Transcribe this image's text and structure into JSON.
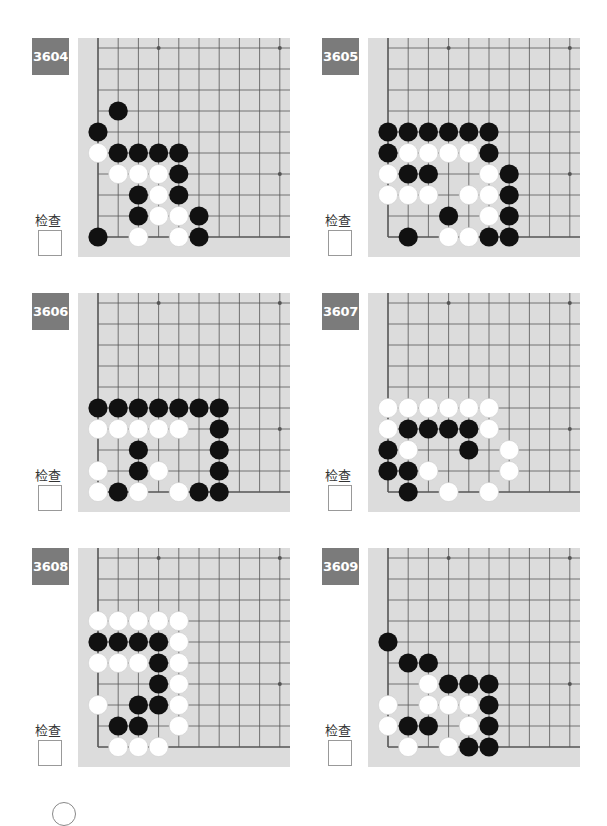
{
  "colors": {
    "badge_bg": "#7b7b7b",
    "board_bg": "#dcdcdc",
    "grid_line": "#555555",
    "black_stone": "#111111",
    "white_stone": "#ffffff"
  },
  "check_label": "检查",
  "problems": [
    {
      "number": "3604",
      "black": [
        [
          1,
          3
        ],
        [
          0,
          4
        ],
        [
          1,
          5
        ],
        [
          2,
          5
        ],
        [
          3,
          5
        ],
        [
          4,
          5
        ],
        [
          4,
          6
        ],
        [
          2,
          7
        ],
        [
          4,
          7
        ],
        [
          2,
          8
        ],
        [
          5,
          8
        ],
        [
          0,
          9
        ],
        [
          5,
          9
        ]
      ],
      "white": [
        [
          0,
          5
        ],
        [
          1,
          6
        ],
        [
          2,
          6
        ],
        [
          3,
          6
        ],
        [
          3,
          7
        ],
        [
          3,
          8
        ],
        [
          4,
          8
        ],
        [
          2,
          9
        ],
        [
          4,
          9
        ]
      ]
    },
    {
      "number": "3605",
      "black": [
        [
          0,
          4
        ],
        [
          1,
          4
        ],
        [
          2,
          4
        ],
        [
          3,
          4
        ],
        [
          4,
          4
        ],
        [
          5,
          4
        ],
        [
          0,
          5
        ],
        [
          5,
          5
        ],
        [
          1,
          6
        ],
        [
          2,
          6
        ],
        [
          6,
          6
        ],
        [
          6,
          7
        ],
        [
          3,
          8
        ],
        [
          6,
          8
        ],
        [
          1,
          9
        ],
        [
          5,
          9
        ],
        [
          6,
          9
        ]
      ],
      "white": [
        [
          1,
          5
        ],
        [
          2,
          5
        ],
        [
          3,
          5
        ],
        [
          4,
          5
        ],
        [
          0,
          6
        ],
        [
          5,
          6
        ],
        [
          0,
          7
        ],
        [
          1,
          7
        ],
        [
          2,
          7
        ],
        [
          4,
          7
        ],
        [
          5,
          7
        ],
        [
          5,
          8
        ],
        [
          3,
          9
        ],
        [
          4,
          9
        ]
      ]
    },
    {
      "number": "3606",
      "black": [
        [
          0,
          5
        ],
        [
          1,
          5
        ],
        [
          2,
          5
        ],
        [
          3,
          5
        ],
        [
          4,
          5
        ],
        [
          5,
          5
        ],
        [
          6,
          5
        ],
        [
          6,
          6
        ],
        [
          2,
          7
        ],
        [
          6,
          7
        ],
        [
          2,
          8
        ],
        [
          6,
          8
        ],
        [
          1,
          9
        ],
        [
          5,
          9
        ],
        [
          6,
          9
        ]
      ],
      "white": [
        [
          0,
          6
        ],
        [
          1,
          6
        ],
        [
          2,
          6
        ],
        [
          3,
          6
        ],
        [
          4,
          6
        ],
        [
          0,
          8
        ],
        [
          3,
          8
        ],
        [
          0,
          9
        ],
        [
          2,
          9
        ],
        [
          4,
          9
        ]
      ]
    },
    {
      "number": "3607",
      "black": [
        [
          1,
          6
        ],
        [
          2,
          6
        ],
        [
          3,
          6
        ],
        [
          4,
          6
        ],
        [
          0,
          7
        ],
        [
          4,
          7
        ],
        [
          0,
          8
        ],
        [
          1,
          8
        ],
        [
          1,
          9
        ]
      ],
      "white": [
        [
          0,
          5
        ],
        [
          1,
          5
        ],
        [
          2,
          5
        ],
        [
          3,
          5
        ],
        [
          4,
          5
        ],
        [
          5,
          5
        ],
        [
          0,
          6
        ],
        [
          5,
          6
        ],
        [
          1,
          7
        ],
        [
          6,
          7
        ],
        [
          2,
          8
        ],
        [
          6,
          8
        ],
        [
          3,
          9
        ],
        [
          5,
          9
        ]
      ]
    },
    {
      "number": "3608",
      "black": [
        [
          0,
          4
        ],
        [
          1,
          4
        ],
        [
          2,
          4
        ],
        [
          3,
          4
        ],
        [
          3,
          5
        ],
        [
          3,
          6
        ],
        [
          2,
          7
        ],
        [
          3,
          7
        ],
        [
          1,
          8
        ],
        [
          2,
          8
        ]
      ],
      "white": [
        [
          0,
          3
        ],
        [
          1,
          3
        ],
        [
          2,
          3
        ],
        [
          3,
          3
        ],
        [
          4,
          3
        ],
        [
          4,
          4
        ],
        [
          0,
          5
        ],
        [
          1,
          5
        ],
        [
          2,
          5
        ],
        [
          4,
          5
        ],
        [
          4,
          6
        ],
        [
          0,
          7
        ],
        [
          4,
          7
        ],
        [
          4,
          8
        ],
        [
          1,
          9
        ],
        [
          2,
          9
        ],
        [
          3,
          9
        ]
      ]
    },
    {
      "number": "3609",
      "black": [
        [
          0,
          4
        ],
        [
          1,
          5
        ],
        [
          2,
          5
        ],
        [
          3,
          6
        ],
        [
          4,
          6
        ],
        [
          5,
          6
        ],
        [
          5,
          7
        ],
        [
          1,
          8
        ],
        [
          2,
          8
        ],
        [
          5,
          8
        ],
        [
          4,
          9
        ],
        [
          5,
          9
        ]
      ],
      "white": [
        [
          2,
          6
        ],
        [
          0,
          7
        ],
        [
          2,
          7
        ],
        [
          3,
          7
        ],
        [
          4,
          7
        ],
        [
          0,
          8
        ],
        [
          4,
          8
        ],
        [
          1,
          9
        ],
        [
          3,
          9
        ]
      ]
    }
  ]
}
